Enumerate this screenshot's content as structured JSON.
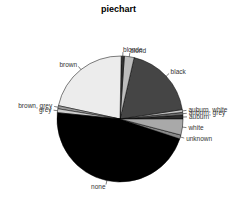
{
  "chart_data": {
    "type": "pie",
    "title": "piechart",
    "xlabel": "",
    "ylabel": "",
    "start_angle_deg": 0,
    "direction": "counterclockwise",
    "categories": [
      "auburn",
      "auburn, grey",
      "auburn, white",
      "black",
      "blond",
      "blonde",
      "brown",
      "brown, grey",
      "grey",
      "none",
      "unknown",
      "white"
    ],
    "values": [
      1.0,
      0.7,
      0.7,
      19.0,
      2.5,
      0.8,
      21.9,
      0.8,
      1.0,
      46.5,
      1.0,
      4.1
    ],
    "colors": [
      "#2b2b2b",
      "#6e6e6e",
      "#c8c8c8",
      "#454545",
      "#bdbdbd",
      "#333333",
      "#ececec",
      "#9a9a9a",
      "#cfcfcf",
      "#000000",
      "#8a8a8a",
      "#a9a9a9"
    ],
    "legend": "none (labels drawn next to slices)"
  }
}
